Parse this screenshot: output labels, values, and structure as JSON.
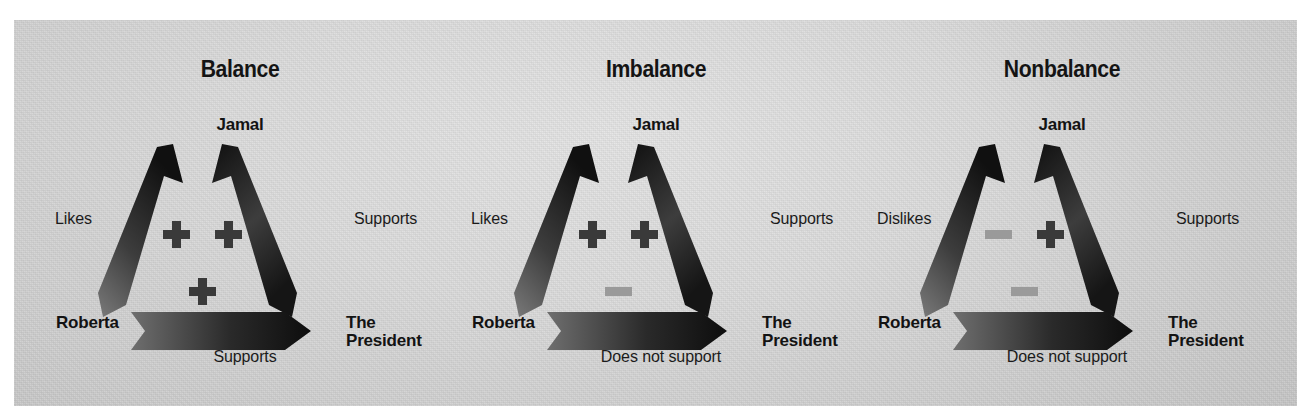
{
  "figure": {
    "kind": "balance-theory-triad-diagram",
    "background_color": "#d6d6d6",
    "plus_color": "#3a3a3a",
    "minus_color": "#9a9a9a",
    "arrow_dark": "#1e1e1e",
    "arrow_light": "#6e6e6e"
  },
  "nodes": {
    "top": "Jamal",
    "left": "Roberta",
    "right": "The\nPresident",
    "right_line1": "The",
    "right_line2": "President"
  },
  "panels": [
    {
      "title": "Balance",
      "node_top": "Jamal",
      "node_left": "Roberta",
      "node_right_line1": "The",
      "node_right_line2": "President",
      "edge_left_label": "Likes",
      "edge_right_label": "Supports",
      "edge_bottom_label": "Supports",
      "signs": [
        {
          "slot": "upper-left",
          "type": "plus",
          "symbol": "+"
        },
        {
          "slot": "upper-right",
          "type": "plus",
          "symbol": "+"
        },
        {
          "slot": "lower-center",
          "type": "plus",
          "symbol": "+"
        }
      ],
      "relations": [
        {
          "from": "Roberta",
          "to": "Jamal",
          "label": "Likes",
          "valence": "+"
        },
        {
          "from": "Jamal",
          "to": "The President",
          "label": "Supports",
          "valence": "+"
        },
        {
          "from": "Roberta",
          "to": "The President",
          "label": "Supports",
          "valence": "+"
        }
      ]
    },
    {
      "title": "Imbalance",
      "node_top": "Jamal",
      "node_left": "Roberta",
      "node_right_line1": "The",
      "node_right_line2": "President",
      "edge_left_label": "Likes",
      "edge_right_label": "Supports",
      "edge_bottom_label": "Does not support",
      "signs": [
        {
          "slot": "upper-left",
          "type": "plus",
          "symbol": "+"
        },
        {
          "slot": "upper-right",
          "type": "plus",
          "symbol": "+"
        },
        {
          "slot": "lower-center",
          "type": "minus",
          "symbol": "−"
        }
      ],
      "relations": [
        {
          "from": "Roberta",
          "to": "Jamal",
          "label": "Likes",
          "valence": "+"
        },
        {
          "from": "Jamal",
          "to": "The President",
          "label": "Supports",
          "valence": "+"
        },
        {
          "from": "Roberta",
          "to": "The President",
          "label": "Does not support",
          "valence": "-"
        }
      ]
    },
    {
      "title": "Nonbalance",
      "node_top": "Jamal",
      "node_left": "Roberta",
      "node_right_line1": "The",
      "node_right_line2": "President",
      "edge_left_label": "Dislikes",
      "edge_right_label": "Supports",
      "edge_bottom_label": "Does not support",
      "signs": [
        {
          "slot": "upper-left",
          "type": "minus",
          "symbol": "−"
        },
        {
          "slot": "upper-right",
          "type": "plus",
          "symbol": "+"
        },
        {
          "slot": "lower-center",
          "type": "minus",
          "symbol": "−"
        }
      ],
      "relations": [
        {
          "from": "Roberta",
          "to": "Jamal",
          "label": "Dislikes",
          "valence": "-"
        },
        {
          "from": "Jamal",
          "to": "The President",
          "label": "Supports",
          "valence": "+"
        },
        {
          "from": "Roberta",
          "to": "The President",
          "label": "Does not support",
          "valence": "-"
        }
      ]
    }
  ]
}
